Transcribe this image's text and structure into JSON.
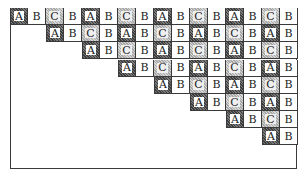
{
  "diagram": {
    "columns": 16,
    "shading": {
      "A": "dark-stippled-frame",
      "B": "none",
      "C": "light-stippled-frame"
    },
    "colors": {
      "border": "#3a3a3a",
      "dark_shade": "#5a5a5a",
      "light_shade": "#bdbdbd",
      "background": "#ffffff"
    },
    "rows": [
      {
        "start_col": 0,
        "cells": [
          "A",
          "B",
          "C",
          "B",
          "A",
          "B",
          "C",
          "B",
          "A",
          "B",
          "C",
          "B",
          "A",
          "B",
          "C",
          "B"
        ]
      },
      {
        "start_col": 2,
        "cells": [
          "A",
          "B",
          "C",
          "B",
          "A",
          "B",
          "C",
          "B",
          "A",
          "B",
          "C",
          "B",
          "A",
          "B"
        ]
      },
      {
        "start_col": 4,
        "cells": [
          "A",
          "B",
          "C",
          "B",
          "A",
          "B",
          "C",
          "B",
          "A",
          "B",
          "C",
          "B"
        ]
      },
      {
        "start_col": 6,
        "cells": [
          "A",
          "B",
          "C",
          "B",
          "A",
          "B",
          "C",
          "B",
          "A",
          "B"
        ]
      },
      {
        "start_col": 8,
        "cells": [
          "A",
          "B",
          "C",
          "B",
          "A",
          "B",
          "C",
          "B"
        ]
      },
      {
        "start_col": 10,
        "cells": [
          "A",
          "B",
          "C",
          "B",
          "A",
          "B"
        ]
      },
      {
        "start_col": 12,
        "cells": [
          "A",
          "B",
          "C",
          "B"
        ]
      },
      {
        "start_col": 14,
        "cells": [
          "A",
          "B"
        ]
      }
    ]
  }
}
